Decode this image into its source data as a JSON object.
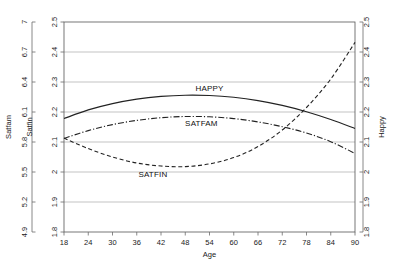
{
  "chart_data": {
    "type": "line",
    "title": "",
    "xlabel": "Age",
    "x": [
      18,
      24,
      30,
      36,
      42,
      48,
      54,
      60,
      66,
      72,
      78,
      84,
      90
    ],
    "xlim": [
      18,
      90
    ],
    "grid": true,
    "legend_position": "inline-labels",
    "axes": [
      {
        "name": "satfam-outer-left",
        "label": "Satfam",
        "position": "outer-left",
        "ticks": [
          "4.9",
          "5.2",
          "5.5",
          "5.8",
          "6.1",
          "6.4",
          "6.7",
          "7"
        ],
        "range": [
          4.9,
          7.0
        ],
        "step": 0.3
      },
      {
        "name": "satfin-inner-left",
        "label": "Satfin",
        "position": "inner-left",
        "ticks": [
          "1.8",
          "1.9",
          "2",
          "2.1",
          "2.2",
          "2.3",
          "2.4",
          "2.5"
        ],
        "range": [
          1.8,
          2.5
        ],
        "step": 0.1
      },
      {
        "name": "happy-right",
        "label": "Happy",
        "position": "right",
        "ticks": [
          "1.8",
          "1.9",
          "2",
          "2.1",
          "2.2",
          "2.3",
          "2.4",
          "2.5"
        ],
        "range": [
          1.8,
          2.5
        ],
        "step": 0.1
      }
    ],
    "xticks": [
      "18",
      "24",
      "30",
      "36",
      "42",
      "48",
      "54",
      "60",
      "66",
      "72",
      "78",
      "84",
      "90"
    ],
    "series": [
      {
        "name": "HAPPY",
        "label": "HAPPY",
        "style": "solid",
        "color": "#222222",
        "label_x": 54,
        "label_y": 2.27,
        "values": [
          2.178,
          2.207,
          2.228,
          2.243,
          2.252,
          2.256,
          2.255,
          2.249,
          2.238,
          2.222,
          2.201,
          2.175,
          2.145
        ]
      },
      {
        "name": "SATFAM",
        "label": "SATFAM",
        "style": "dash-dot",
        "color": "#222222",
        "label_x": 52,
        "label_y": 2.155,
        "values": [
          2.112,
          2.138,
          2.158,
          2.172,
          2.181,
          2.185,
          2.184,
          2.178,
          2.167,
          2.151,
          2.13,
          2.101,
          2.062
        ]
      },
      {
        "name": "SATFIN",
        "label": "SATFIN",
        "style": "dashed",
        "color": "#222222",
        "label_x": 40,
        "label_y": 1.985,
        "values": [
          2.113,
          2.078,
          2.05,
          2.03,
          2.02,
          2.018,
          2.027,
          2.048,
          2.085,
          2.14,
          2.215,
          2.31,
          2.432
        ]
      }
    ]
  }
}
